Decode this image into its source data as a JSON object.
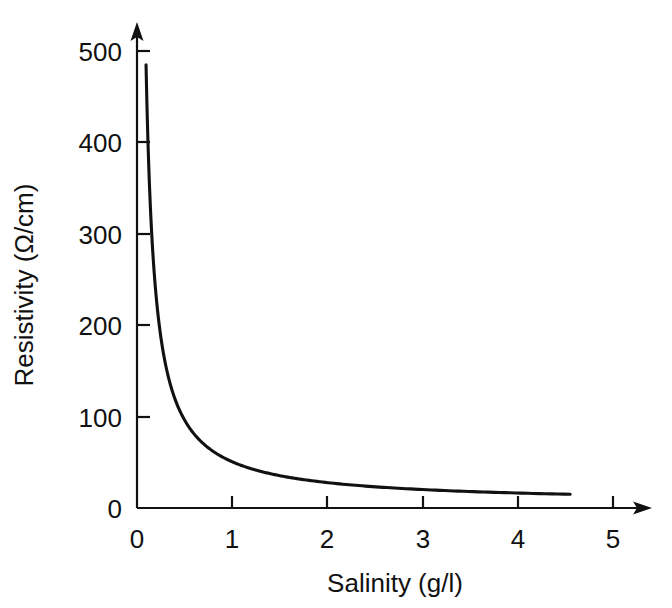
{
  "chart_data": {
    "type": "line",
    "title": "",
    "xlabel": "Salinity (g/l)",
    "ylabel": "Resistivity (Ω/cm)",
    "xlim": [
      0,
      5.4
    ],
    "ylim": [
      0,
      540
    ],
    "xticks": [
      0,
      1,
      2,
      3,
      4,
      5
    ],
    "xtick_labels": [
      "0",
      "1",
      "2",
      "3",
      "4",
      "5"
    ],
    "yticks": [
      0,
      100,
      200,
      300,
      400,
      500
    ],
    "ytick_labels": [
      "0",
      "100",
      "200",
      "300",
      "400",
      "500"
    ],
    "grid": false,
    "legend": null,
    "axis_style": "open-arrow-axes",
    "series": [
      {
        "name": "Resistivity vs salinity",
        "x": [
          0.095,
          0.12,
          0.15,
          0.18,
          0.22,
          0.26,
          0.3,
          0.35,
          0.4,
          0.45,
          0.5,
          0.6,
          0.66,
          0.7,
          0.8,
          0.9,
          1.0,
          1.2,
          1.4,
          1.6,
          1.8,
          2.0,
          2.25,
          2.5,
          2.75,
          3.0,
          3.25,
          3.5,
          3.75,
          4.0,
          4.25,
          4.55
        ],
        "y": [
          485,
          400,
          330,
          300,
          255,
          218,
          195,
          170,
          200,
          133,
          122,
          103,
          100,
          95,
          86,
          78,
          71,
          61,
          54,
          48,
          42,
          37,
          34,
          32,
          29,
          27,
          25,
          24,
          22,
          20,
          18,
          15
        ]
      }
    ]
  },
  "axis_labels": {
    "x_title": "Salinity (g/l)",
    "y_title": "Resistivity (Ω/cm)"
  },
  "colors": {
    "ink": "#111111",
    "background": "#ffffff"
  }
}
